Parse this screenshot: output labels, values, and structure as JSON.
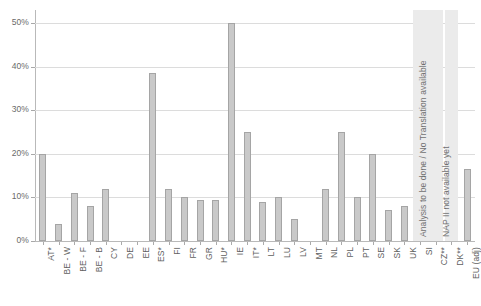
{
  "chart_data": {
    "type": "bar",
    "title": "",
    "subtitle": "",
    "xlabel": "",
    "ylabel": "",
    "ylim": [
      0,
      50
    ],
    "grid": true,
    "legend": "none",
    "ytick_labels": [
      "0%",
      "10%",
      "20%",
      "30%",
      "40%",
      "50%"
    ],
    "ytick_values": [
      0,
      10,
      20,
      30,
      40,
      50
    ],
    "categories": [
      "AT*",
      "BE - W",
      "BE - F",
      "BE - B",
      "CY",
      "DE",
      "EE",
      "ES*",
      "FI",
      "FR",
      "GR",
      "HU*",
      "IE",
      "IT*",
      "LT",
      "LU",
      "LV",
      "MT",
      "NL",
      "PL",
      "PT",
      "SE",
      "SK",
      "UK",
      "SI",
      "CZ**",
      "DK**",
      "EU (adj)"
    ],
    "values": [
      20,
      4,
      11,
      8,
      12,
      0,
      0,
      38.5,
      12,
      10,
      9.5,
      9.5,
      50,
      25,
      9,
      10,
      5,
      0,
      12,
      25,
      10,
      20,
      7,
      8,
      null,
      null,
      null,
      16.5
    ],
    "annotations": [
      {
        "text": "Analysis to be done / No Translation available",
        "covers": [
          "SI",
          "CZ**"
        ]
      },
      {
        "text": "NAP II not available yet",
        "covers": [
          "DK**"
        ]
      }
    ],
    "colors": {
      "bar_fill": "#c9c9c9",
      "bar_border": "#a5a5a5",
      "gridline": "#dcdcdc",
      "axis": "#b9b9b9",
      "band_fill": "#ebebeb",
      "text": "#5f5f5f",
      "background": "#ffffff"
    }
  }
}
